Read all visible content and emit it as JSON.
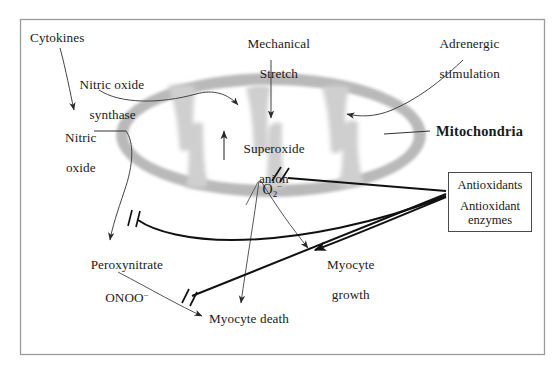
{
  "figure": {
    "background_color": "#ffffff",
    "frame": {
      "name": "outer-frame",
      "x": 20,
      "y": 19,
      "width": 525,
      "height": 336,
      "stroke": "#9a9a9a",
      "stroke_width": 1.2
    }
  },
  "colors": {
    "text": "#1a1a1a",
    "line": "#2a2a2a",
    "thin_line": "#555555",
    "membrane_gray": "#b9b9b9",
    "cristae_gray": "#d2d2d2",
    "matrix_white": "#ffffff",
    "box_border": "#4a4a4a",
    "frame": "#9a9a9a"
  },
  "labels": {
    "cytokines": {
      "text": "Cytokines",
      "x": 30,
      "y": 37
    },
    "nitric_oxide_synthase": {
      "line1": "Nitric oxide",
      "line2": "synthase",
      "x": 66,
      "y": 68
    },
    "nitric_oxide": {
      "line1": "Nitric",
      "line2": "oxide",
      "x": 55,
      "y": 121
    },
    "mechanical_stretch": {
      "line1": "Mechanical",
      "line2": "Stretch",
      "x": 244,
      "y": 27
    },
    "adrenergic_stimulation": {
      "line1": "Adrenergic",
      "line2": "stimulation",
      "x": 424,
      "y": 27
    },
    "mitochondria": {
      "text": "Mitochondria",
      "x": 436,
      "y": 126
    },
    "superoxide_anion": {
      "line1": "Superoxide",
      "line2": "anion",
      "x": 232,
      "y": 132
    },
    "superoxide_formula": {
      "base": "O",
      "subscript": "2",
      "superscript": "–",
      "x": 249,
      "y": 168
    },
    "peroxynitrate": {
      "line1": "Peroxynitrate",
      "line2_base": "ONOO",
      "line2_sup": "–",
      "x": 85,
      "y": 249
    },
    "myocyte_growth": {
      "line1": "Myocyte",
      "line2": "growth",
      "x": 318,
      "y": 248
    },
    "myocyte_death": {
      "text": "Myocyte death",
      "x": 209,
      "y": 318
    }
  },
  "antioxidants_box": {
    "name": "antioxidants-box",
    "x": 448,
    "y": 172,
    "width": 84,
    "height": 60,
    "line1": "Antioxidants",
    "line2": "Antioxidant",
    "line3": "enzymes"
  },
  "arrows": [
    {
      "name": "cytokines-to-nitric-oxide",
      "style": "thin-arrow",
      "from": "Cytokines",
      "to": "Nitric oxide"
    },
    {
      "name": "nitric-oxide-synthase-to-mitochondria",
      "style": "thin-arrow",
      "from": "Nitric oxide synthase",
      "to": "Mitochondria matrix"
    },
    {
      "name": "mechanical-stretch-to-mitochondria",
      "style": "thin-arrow",
      "from": "Mechanical Stretch",
      "to": "Mitochondria matrix"
    },
    {
      "name": "adrenergic-stimulation-to-mitochondria",
      "style": "thin-arrow",
      "from": "Adrenergic stimulation",
      "to": "Mitochondria matrix"
    },
    {
      "name": "mitochondria-leader-line",
      "style": "plain-line",
      "from": "Mitochondria label",
      "to": "Outer membrane"
    },
    {
      "name": "superoxide-anion-production-arrow",
      "style": "thin-arrow",
      "from": "Mitochondrial matrix",
      "to": "Superoxide anion"
    },
    {
      "name": "nitric-oxide-to-peroxynitrate",
      "style": "thin-arrow",
      "from": "Nitric oxide",
      "to": "Peroxynitrate ONOO-"
    },
    {
      "name": "superoxide-to-peroxynitrate",
      "style": "thin-arrow",
      "from": "O2-",
      "to": "Peroxynitrate ONOO-"
    },
    {
      "name": "superoxide-to-myocyte-death",
      "style": "thin-arrow",
      "from": "O2-",
      "to": "Myocyte death"
    },
    {
      "name": "superoxide-to-myocyte-growth",
      "style": "thin-arrow",
      "from": "O2-",
      "to": "Myocyte growth"
    },
    {
      "name": "peroxynitrate-to-myocyte-death",
      "style": "thin-arrow",
      "from": "Peroxynitrate ONOO-",
      "to": "Myocyte death"
    },
    {
      "name": "antioxidants-inhibit-superoxide",
      "style": "inhibition",
      "from": "Antioxidants",
      "to": "O2- production",
      "marker": "double-slash"
    },
    {
      "name": "antioxidants-inhibit-peroxynitrate",
      "style": "inhibition",
      "from": "Antioxidants",
      "to": "Peroxynitrate",
      "marker": "double-slash"
    },
    {
      "name": "antioxidants-inhibit-myocyte-death",
      "style": "inhibition",
      "from": "Antioxidants",
      "to": "Myocyte death pathway",
      "marker": "double-slash"
    },
    {
      "name": "antioxidants-to-myocyte-growth",
      "style": "thin-arrow",
      "from": "Antioxidants",
      "to": "Myocyte growth"
    }
  ]
}
